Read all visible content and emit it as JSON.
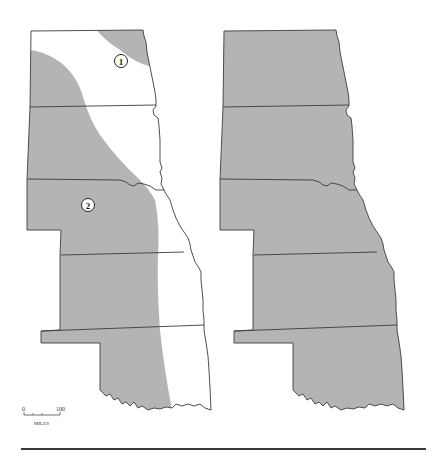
{
  "figure": {
    "panels": [
      {
        "id": "left",
        "description": "Great Plains states with two shaded/unshaded zones",
        "zones": [
          {
            "label": "1"
          },
          {
            "label": "2"
          }
        ]
      },
      {
        "id": "right",
        "description": "Great Plains states fully shaded"
      }
    ],
    "colors": {
      "shade": "#b4b4b4",
      "outline": "#3c3c3c",
      "background": "#ffffff"
    },
    "scale_bar": {
      "min_label": "0",
      "max_label": "100",
      "unit_label": "MILES"
    }
  }
}
